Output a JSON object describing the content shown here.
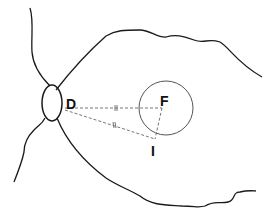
{
  "diagram": {
    "type": "retina-fundus-schematic",
    "labels": {
      "disc": "D",
      "fovea": "F",
      "point": "I"
    },
    "colors": {
      "stroke": "#1a1a1a",
      "circle": "#555555",
      "dashed": "#666666",
      "background": "#ffffff"
    },
    "tick_marks": {
      "DF": "||",
      "DI": "||"
    }
  }
}
